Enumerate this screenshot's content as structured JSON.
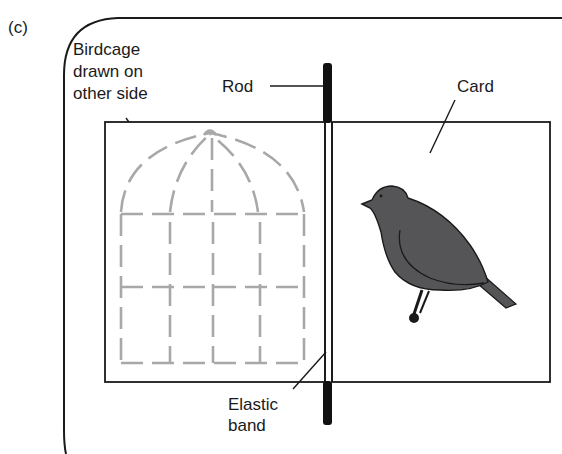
{
  "figure": {
    "panel_label": "(c)",
    "labels": {
      "birdcage": [
        "Birdcage",
        "drawn on",
        "other side"
      ],
      "rod": "Rod",
      "card": "Card",
      "elastic_band": [
        "Elastic",
        "band"
      ]
    },
    "colors": {
      "outline": "#1a1a1a",
      "cage": "#a8a8a8",
      "bird": "#555558",
      "rod": "#111111"
    }
  }
}
